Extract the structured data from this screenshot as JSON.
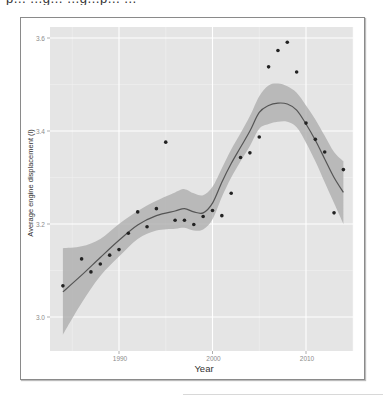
{
  "page": {
    "top_text_cut": "p… …g… …g…p… …"
  },
  "colors": {
    "panel_bg": "#e5e5e5",
    "grid_major": "#ffffff",
    "grid_minor": "#f0f0f0",
    "ribbon": "#a9a9a9",
    "line": "#555555",
    "point": "#222222",
    "axis_text": "#8c8c8c",
    "axis_title": "#333333"
  },
  "chart_data": {
    "type": "scatter",
    "title": "",
    "xlabel": "Year",
    "ylabel": "Average engine displacement (l)",
    "xlim": [
      1982.8,
      2015.5
    ],
    "ylim": [
      2.926,
      3.622
    ],
    "x_ticks": [
      1990,
      2000,
      2010
    ],
    "x_tick_labels": [
      "1990",
      "2000",
      "2010"
    ],
    "y_ticks": [
      3.0,
      3.2,
      3.4,
      3.6
    ],
    "y_tick_labels": [
      "3.0",
      "3.2",
      "3.4",
      "3.6"
    ],
    "grid": true,
    "legend": null,
    "series": [
      {
        "name": "points",
        "kind": "scatter",
        "x": [
          1984,
          1986,
          1987,
          1988,
          1989,
          1990,
          1991,
          1992,
          1993,
          1994,
          1995,
          1996,
          1997,
          1998,
          1999,
          2000,
          2001,
          2002,
          2003,
          2004,
          2005,
          2006,
          2007,
          2008,
          2009,
          2010,
          2011,
          2012,
          2013,
          2014
        ],
        "y": [
          3.067,
          3.125,
          3.097,
          3.114,
          3.133,
          3.145,
          3.18,
          3.226,
          3.194,
          3.233,
          3.376,
          3.208,
          3.208,
          3.199,
          3.216,
          3.229,
          3.218,
          3.266,
          3.343,
          3.353,
          3.387,
          3.538,
          3.573,
          3.591,
          3.527,
          3.417,
          3.382,
          3.355,
          3.224,
          3.317
        ]
      },
      {
        "name": "loess smooth",
        "kind": "line",
        "x": [
          1984,
          1986,
          1988,
          1990,
          1992,
          1994,
          1996,
          1997,
          1998,
          1999,
          2000,
          2001,
          2002,
          2003,
          2004,
          2005,
          2006,
          2007,
          2008,
          2009,
          2010,
          2011,
          2012,
          2013,
          2014
        ],
        "y": [
          3.054,
          3.09,
          3.128,
          3.165,
          3.198,
          3.218,
          3.228,
          3.233,
          3.226,
          3.224,
          3.245,
          3.29,
          3.33,
          3.365,
          3.4,
          3.44,
          3.455,
          3.46,
          3.458,
          3.445,
          3.415,
          3.38,
          3.34,
          3.3,
          3.268
        ]
      },
      {
        "name": "confidence band",
        "kind": "area",
        "x": [
          1984,
          1986,
          1988,
          1990,
          1992,
          1994,
          1996,
          1997,
          1998,
          1999,
          2000,
          2001,
          2002,
          2003,
          2004,
          2005,
          2006,
          2007,
          2008,
          2009,
          2010,
          2011,
          2012,
          2013,
          2014
        ],
        "y_upper": [
          3.148,
          3.152,
          3.168,
          3.2,
          3.228,
          3.25,
          3.268,
          3.275,
          3.266,
          3.262,
          3.28,
          3.32,
          3.36,
          3.395,
          3.432,
          3.475,
          3.498,
          3.502,
          3.496,
          3.482,
          3.455,
          3.425,
          3.39,
          3.355,
          3.335
        ],
        "y_lower": [
          2.962,
          3.03,
          3.088,
          3.13,
          3.168,
          3.186,
          3.19,
          3.192,
          3.186,
          3.188,
          3.21,
          3.258,
          3.3,
          3.335,
          3.368,
          3.405,
          3.415,
          3.42,
          3.42,
          3.408,
          3.375,
          3.335,
          3.29,
          3.245,
          3.2
        ]
      }
    ]
  }
}
